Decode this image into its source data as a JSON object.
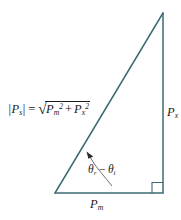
{
  "figure": {
    "type": "geometry-diagram",
    "background_color": "#ffffff",
    "stroke_color": "#3d6b73",
    "text_color": "#1b1b1b",
    "width": 181,
    "height": 220
  },
  "triangle": {
    "apex": {
      "x": 163,
      "y": 13
    },
    "bottom_left": {
      "x": 55,
      "y": 193
    },
    "bottom_right": {
      "x": 163,
      "y": 193
    },
    "right_angle_marker": {
      "at": "bottom_right",
      "size": 10,
      "label": "right-angle"
    }
  },
  "formula": {
    "lhs_bar_open": "|",
    "lhs_symbol": "P",
    "lhs_subscript": "s",
    "lhs_bar_close": "|",
    "equals": "=",
    "radical_sign": "√",
    "term1_symbol": "P",
    "term1_subscript": "m",
    "term1_superscript": "2",
    "plus": "+",
    "term2_symbol": "P",
    "term2_subscript": "x",
    "term2_superscript": "2",
    "plain_text": "|Ps| = √(Pm² + Px²)"
  },
  "labels": {
    "vertical_leg": {
      "symbol": "P",
      "subscript": "x",
      "plain_text": "Px"
    },
    "horizontal_leg": {
      "symbol": "P",
      "subscript": "m",
      "plain_text": "Pm"
    },
    "angle": {
      "theta1_symbol": "θ",
      "theta1_subscript": "r",
      "minus": "−",
      "theta2_symbol": "θ",
      "theta2_subscript": "i",
      "plain_text": "θr − θi"
    }
  },
  "annotation_arrow": {
    "description": "curved leader from angle label to hypotenuse",
    "arrowhead_at": {
      "x": 87,
      "y": 153
    },
    "tail_at": {
      "x": 110,
      "y": 185
    }
  }
}
